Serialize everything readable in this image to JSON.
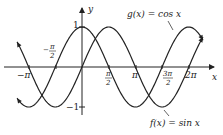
{
  "chart_data": {
    "type": "line",
    "title": "",
    "xlabel": "x",
    "ylabel": "y",
    "xlim": [
      -3.82,
      7.12
    ],
    "ylim": [
      -1,
      1
    ],
    "grid": false,
    "x_ticks": [
      "-π",
      "-π/2",
      "π/2",
      "π",
      "3π/2",
      "2π"
    ],
    "y_ticks": [
      "1",
      "-1"
    ],
    "series": [
      {
        "name": "f(x) = sin x",
        "function": "sin",
        "color": "#222222"
      },
      {
        "name": "g(x) = cos x",
        "function": "cos",
        "color": "#222222"
      }
    ],
    "annotations": [
      {
        "text": "g(x) = cos x",
        "points_to": "cos curve near x≈5.8"
      },
      {
        "text": "f(x) = sin x",
        "points_to": "sin curve near x≈4.7 (minimum)"
      }
    ]
  },
  "labels": {
    "y_axis": "y",
    "x_axis": "x",
    "tick_one": "1",
    "tick_neg_one": "−1",
    "tick_neg_pi": "−π",
    "tick_neg_half_pi_num": "π",
    "tick_neg_half_pi_den": "2",
    "tick_neg_half_pi_sign": "−",
    "tick_half_pi_num": "π",
    "tick_half_pi_den": "2",
    "tick_pi": "π",
    "tick_three_half_pi_num": "3π",
    "tick_three_half_pi_den": "2",
    "tick_two_pi": "2π",
    "g_label": "g(x) = cos x",
    "f_label": "f(x) = sin x"
  }
}
